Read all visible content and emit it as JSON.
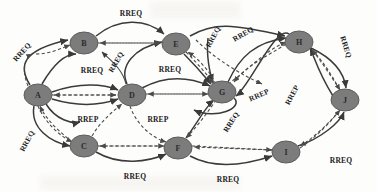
{
  "diagram": {
    "node_fill": "#7c7c7c",
    "node_stroke": "#5d5d5d",
    "edge_color": "#3a3a3a",
    "label_color": "#1c1c1c",
    "background": "#fdfdfc",
    "nodes": [
      {
        "id": "A",
        "label": "A",
        "cx": 38,
        "cy": 95,
        "rx": 14,
        "ry": 11
      },
      {
        "id": "B",
        "label": "B",
        "cx": 84,
        "cy": 43,
        "rx": 14,
        "ry": 11
      },
      {
        "id": "C",
        "label": "C",
        "cx": 84,
        "cy": 146,
        "rx": 14,
        "ry": 11
      },
      {
        "id": "D",
        "label": "D",
        "cx": 132,
        "cy": 95,
        "rx": 14,
        "ry": 11
      },
      {
        "id": "E",
        "label": "E",
        "cx": 176,
        "cy": 44,
        "rx": 14,
        "ry": 11
      },
      {
        "id": "F",
        "label": "F",
        "cx": 178,
        "cy": 148,
        "rx": 14,
        "ry": 11
      },
      {
        "id": "G",
        "label": "G",
        "cx": 222,
        "cy": 92,
        "rx": 14,
        "ry": 11
      },
      {
        "id": "H",
        "label": "H",
        "cx": 299,
        "cy": 42,
        "rx": 14,
        "ry": 11
      },
      {
        "id": "I",
        "label": "I",
        "cx": 286,
        "cy": 152,
        "rx": 14,
        "ry": 11
      },
      {
        "id": "J",
        "label": "J",
        "cx": 345,
        "cy": 100,
        "rx": 14,
        "ry": 11
      }
    ],
    "edge_labels": [
      {
        "id": "lbl-a-b",
        "text": "RREQ",
        "x": 22,
        "y": 52,
        "rotate": -48
      },
      {
        "id": "lbl-b-e",
        "text": "RREQ",
        "x": 131,
        "y": 13,
        "rotate": 0
      },
      {
        "id": "lbl-a-d",
        "text": "RREQ",
        "x": 92,
        "y": 70,
        "rotate": 0
      },
      {
        "id": "lbl-d-e",
        "text": "RREQ",
        "x": 116,
        "y": 62,
        "rotate": -60
      },
      {
        "id": "lbl-e-g",
        "text": "RREQ",
        "x": 170,
        "y": 69,
        "rotate": 0
      },
      {
        "id": "lbl-e-h",
        "text": "RREQ",
        "x": 213,
        "y": 37,
        "rotate": -62
      },
      {
        "id": "lbl-g-h",
        "text": "RREQ",
        "x": 243,
        "y": 34,
        "rotate": -30
      },
      {
        "id": "lbl-h-j",
        "text": "RREQ",
        "x": 346,
        "y": 47,
        "rotate": 72
      },
      {
        "id": "lbl-a-d2",
        "text": "RREP",
        "x": 88,
        "y": 119,
        "rotate": 0
      },
      {
        "id": "lbl-d-g",
        "text": "RREP",
        "x": 158,
        "y": 119,
        "rotate": 0
      },
      {
        "id": "lbl-a-c",
        "text": "RREQ",
        "x": 27,
        "y": 141,
        "rotate": -62
      },
      {
        "id": "lbl-c-f",
        "text": "RREQ",
        "x": 135,
        "y": 176,
        "rotate": 0
      },
      {
        "id": "lbl-f-g",
        "text": "RREQ",
        "x": 231,
        "y": 122,
        "rotate": -58
      },
      {
        "id": "lbl-g-j",
        "text": "RREP",
        "x": 259,
        "y": 95,
        "rotate": -24
      },
      {
        "id": "lbl-h-j2",
        "text": "RREP",
        "x": 292,
        "y": 95,
        "rotate": -62
      },
      {
        "id": "lbl-f-i",
        "text": "RREQ",
        "x": 228,
        "y": 179,
        "rotate": 0
      },
      {
        "id": "lbl-i-j",
        "text": "RREQ",
        "x": 341,
        "y": 160,
        "rotate": 0
      }
    ]
  }
}
